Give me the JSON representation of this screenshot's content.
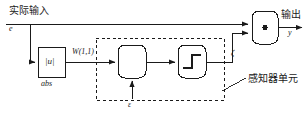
{
  "diagram": {
    "type": "block-diagram",
    "background": "#ffffff",
    "line_color": "#1a1a1a",
    "dashed_color": "#1a1a1a"
  },
  "labels": {
    "input_cn": "实际输入",
    "input_sym": "e",
    "output_cn": "输出",
    "output_sym": "y",
    "abs_block_text": "|u|",
    "abs_block_caption": "abs",
    "weight": "W(1,1)",
    "bias_sym": "ε",
    "zeta_sym": "ζ",
    "perceptron_cn": "感知器单元"
  },
  "blocks": [
    {
      "name": "abs-block",
      "label": "|u|",
      "caption": "abs",
      "shape": "rect",
      "x": 38,
      "y": 47,
      "w": 27,
      "h": 30
    },
    {
      "name": "sum-block",
      "label": "",
      "shape": "rounded-rect",
      "x": 118,
      "y": 45,
      "w": 28,
      "h": 33
    },
    {
      "name": "hardlim-block",
      "label": "step",
      "shape": "rounded-rect",
      "x": 178,
      "y": 45,
      "w": 28,
      "h": 33
    },
    {
      "name": "product-block",
      "label": "dot",
      "shape": "rounded-rect",
      "x": 252,
      "y": 11,
      "w": 26,
      "h": 33
    }
  ],
  "dashed_region": {
    "name": "perceptron-unit-region",
    "x": 96,
    "y": 38,
    "w": 128,
    "h": 62
  }
}
